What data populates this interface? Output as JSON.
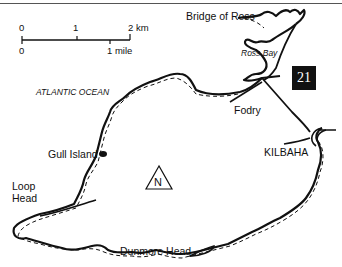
{
  "map": {
    "scale": {
      "km_start": "0",
      "km_mid": "1",
      "km_end": "2 km",
      "mile_start": "0",
      "mile_end": "1 mile"
    },
    "route_number": "21",
    "labels": {
      "ocean": "ATLANTIC OCEAN",
      "bridge_of_ross": "Bridge of Ross",
      "ross_bay": "Ross Bay",
      "fodry": "Fodry",
      "kilbaha": "KILBAHA",
      "gull_island": "Gull Island",
      "loop_head_1": "Loop",
      "loop_head_2": "Head",
      "dunmore_head": "Dunmore Head",
      "north": "N"
    }
  }
}
